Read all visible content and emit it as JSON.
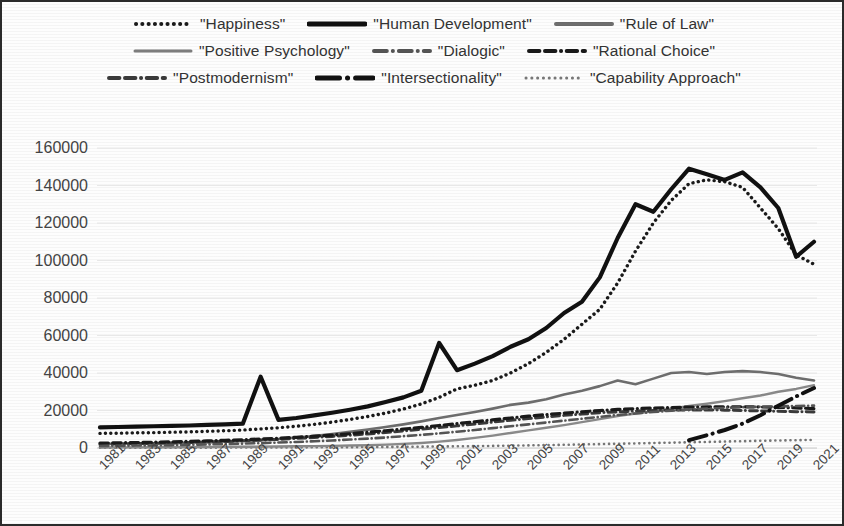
{
  "chart_data": {
    "type": "line",
    "title": "",
    "xlabel": "",
    "ylabel": "",
    "xlim": [
      1981,
      2021
    ],
    "ylim": [
      0,
      160000
    ],
    "grid": true,
    "legend_position": "top",
    "ytick_labels": [
      "160000",
      "140000",
      "120000",
      "100000",
      "80000",
      "60000",
      "40000",
      "20000",
      "0"
    ],
    "ytick_values": [
      160000,
      140000,
      120000,
      100000,
      80000,
      60000,
      40000,
      20000,
      0
    ],
    "x": [
      1981,
      1982,
      1983,
      1984,
      1985,
      1986,
      1987,
      1988,
      1989,
      1990,
      1991,
      1992,
      1993,
      1994,
      1995,
      1996,
      1997,
      1998,
      1999,
      2000,
      2001,
      2002,
      2003,
      2004,
      2005,
      2006,
      2007,
      2008,
      2009,
      2010,
      2011,
      2012,
      2013,
      2014,
      2015,
      2016,
      2017,
      2018,
      2019,
      2020,
      2021
    ],
    "xtick_labels": [
      "1981",
      "1983",
      "1985",
      "1987",
      "1989",
      "1991",
      "1993",
      "1995",
      "1997",
      "1999",
      "2001",
      "2003",
      "2005",
      "2007",
      "2009",
      "2011",
      "2013",
      "2015",
      "2017",
      "2019",
      "2021"
    ],
    "series": [
      {
        "name": "\"Happiness\"",
        "style": "dotted",
        "color": "#1a1a1a",
        "width": 3.4,
        "values": [
          7800,
          7900,
          8100,
          8200,
          8400,
          8600,
          8900,
          9200,
          9600,
          10200,
          10800,
          11600,
          12600,
          13800,
          15200,
          16800,
          18600,
          20800,
          23500,
          27000,
          31500,
          33500,
          36000,
          40000,
          45000,
          51000,
          58000,
          66000,
          74000,
          88000,
          105000,
          120000,
          132000,
          141000,
          143000,
          142000,
          139000,
          128000,
          117000,
          103000,
          98000
        ]
      },
      {
        "name": "\"Human Development\"",
        "style": "solid",
        "color": "#111111",
        "width": 4.2,
        "values": [
          11000,
          11200,
          11400,
          11600,
          11800,
          12000,
          12300,
          12600,
          13000,
          38000,
          15000,
          16000,
          17400,
          18800,
          20400,
          22200,
          24500,
          27000,
          30500,
          56000,
          41500,
          45000,
          49000,
          54000,
          58000,
          64000,
          72000,
          78000,
          91000,
          112000,
          130000,
          126000,
          138000,
          149000,
          146000,
          143000,
          147000,
          139000,
          128000,
          102000,
          110000
        ]
      },
      {
        "name": "\"Rule of Law\"",
        "style": "solid",
        "color": "#6e6e6e",
        "width": 2.6,
        "values": [
          2200,
          2300,
          2400,
          2500,
          2600,
          2800,
          3000,
          3300,
          3700,
          4200,
          4800,
          5600,
          6400,
          7400,
          8600,
          9800,
          11200,
          12600,
          14200,
          16000,
          17600,
          19200,
          21000,
          23000,
          24200,
          26000,
          28500,
          30500,
          33000,
          36000,
          34000,
          37000,
          40000,
          40500,
          39500,
          40500,
          41000,
          40500,
          39500,
          37500,
          36000
        ]
      },
      {
        "name": "\"Positive Psychology\"",
        "style": "solid",
        "color": "#8a8a8a",
        "width": 2.4,
        "values": [
          300,
          320,
          350,
          380,
          420,
          470,
          520,
          580,
          650,
          720,
          800,
          900,
          1000,
          1150,
          1300,
          1500,
          1800,
          2200,
          2700,
          3400,
          4300,
          5400,
          6600,
          8000,
          9400,
          10800,
          12200,
          13800,
          15400,
          17000,
          18400,
          19600,
          21000,
          22400,
          23600,
          25000,
          26500,
          28000,
          30000,
          31500,
          33500
        ]
      },
      {
        "name": "\"Dialogic\"",
        "style": "dashdot",
        "color": "#555555",
        "width": 2.6,
        "values": [
          1100,
          1200,
          1300,
          1400,
          1550,
          1700,
          1900,
          2100,
          2350,
          2600,
          2900,
          3200,
          3600,
          4000,
          4500,
          5000,
          5600,
          6300,
          7000,
          7800,
          8700,
          9600,
          10600,
          11600,
          12600,
          13600,
          14600,
          15600,
          16600,
          17600,
          18400,
          19200,
          19900,
          20500,
          21000,
          21400,
          21800,
          22000,
          22200,
          22400,
          22600
        ]
      },
      {
        "name": "\"Rational Choice\"",
        "style": "dashdashdot",
        "color": "#1a1a1a",
        "width": 3.2,
        "values": [
          2600,
          2750,
          2900,
          3100,
          3300,
          3550,
          3800,
          4100,
          4400,
          4800,
          5200,
          5700,
          6300,
          6900,
          7600,
          8400,
          9200,
          10100,
          11000,
          12000,
          13000,
          14000,
          15000,
          16000,
          17000,
          17800,
          18600,
          19300,
          20000,
          20600,
          21000,
          21300,
          21600,
          21800,
          21900,
          22000,
          22000,
          21900,
          21700,
          21400,
          21000
        ]
      },
      {
        "name": "\"Postmodernism\"",
        "style": "dashdashdot",
        "color": "#3a3a3a",
        "width": 3.0,
        "values": [
          2000,
          2150,
          2300,
          2500,
          2700,
          2950,
          3200,
          3500,
          3850,
          4200,
          4600,
          5100,
          5600,
          6200,
          6800,
          7500,
          8300,
          9100,
          10000,
          10900,
          11800,
          12800,
          13800,
          14800,
          15700,
          16600,
          17400,
          18100,
          18800,
          19300,
          19700,
          20000,
          20200,
          20300,
          20300,
          20200,
          20000,
          19800,
          19600,
          19400,
          19200
        ]
      },
      {
        "name": "\"Intersectionality\"",
        "style": "thicksolid-dot",
        "color": "#111111",
        "width": 4.0,
        "values": [
          null,
          null,
          null,
          null,
          null,
          null,
          null,
          null,
          null,
          null,
          null,
          null,
          null,
          null,
          null,
          null,
          null,
          null,
          null,
          null,
          null,
          null,
          null,
          null,
          null,
          null,
          null,
          null,
          null,
          null,
          null,
          null,
          null,
          4200,
          6800,
          9600,
          13000,
          17500,
          22500,
          27500,
          32000
        ]
      },
      {
        "name": "\"Capability Approach\"",
        "style": "finedotted",
        "color": "#777777",
        "width": 2.6,
        "values": [
          120,
          130,
          140,
          150,
          165,
          180,
          200,
          220,
          245,
          270,
          300,
          330,
          370,
          410,
          460,
          510,
          570,
          640,
          720,
          800,
          900,
          1000,
          1120,
          1250,
          1400,
          1560,
          1720,
          1900,
          2080,
          2260,
          2450,
          2650,
          2850,
          3050,
          3250,
          3450,
          3650,
          3850,
          4000,
          4150,
          4300
        ]
      }
    ]
  },
  "legend": {
    "rows": [
      [
        {
          "label": "\"Happiness\"",
          "style": "dotted",
          "color": "#1a1a1a",
          "width": 4
        },
        {
          "label": "\"Human Development\"",
          "style": "solid",
          "color": "#111111",
          "width": 5
        },
        {
          "label": "\"Rule of Law\"",
          "style": "solid",
          "color": "#6e6e6e",
          "width": 4
        }
      ],
      [
        {
          "label": "\"Positive Psychology\"",
          "style": "solid",
          "color": "#7d7d7d",
          "width": 3
        },
        {
          "label": "\"Dialogic\"",
          "style": "dashdot",
          "color": "#555555",
          "width": 4
        },
        {
          "label": "\"Rational Choice\"",
          "style": "dashdashdot",
          "color": "#1a1a1a",
          "width": 4
        }
      ],
      [
        {
          "label": "\"Postmodernism\"",
          "style": "dashdashdot",
          "color": "#3a3a3a",
          "width": 4
        },
        {
          "label": "\"Intersectionality\"",
          "style": "thicksolid-dot",
          "color": "#111111",
          "width": 5
        },
        {
          "label": "\"Capability Approach\"",
          "style": "finedotted",
          "color": "#777777",
          "width": 3
        }
      ]
    ]
  }
}
